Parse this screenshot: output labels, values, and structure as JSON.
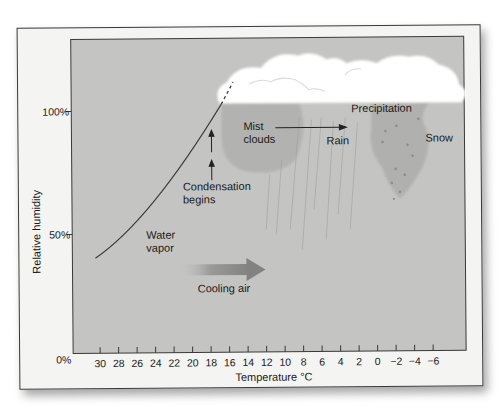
{
  "diagram": {
    "y_axis": {
      "label": "Relative humidity",
      "ticks": [
        "100%",
        "50%",
        "0%"
      ]
    },
    "x_axis": {
      "label": "Temperature °C",
      "ticks": [
        "30",
        "28",
        "26",
        "24",
        "22",
        "20",
        "18",
        "16",
        "14",
        "12",
        "10",
        "8",
        "6",
        "4",
        "2",
        "0",
        "−2",
        "−4",
        "−6"
      ]
    },
    "labels": {
      "water_vapor_1": "Water",
      "water_vapor_2": "vapor",
      "cooling_air": "Cooling air",
      "condensation_1": "Condensation",
      "condensation_2": "begins",
      "mist_1": "Mist",
      "mist_2": "clouds",
      "rain": "Rain",
      "precipitation": "Precipitation",
      "snow": "Snow"
    },
    "colors": {
      "plot_bg": "#c4c4c2",
      "frame_bg": "#f4f4f2",
      "cloud": "#ffffff",
      "mist": "#b2b2b0",
      "snow_zone": "#b0b0ae",
      "arrow": "#8a8a88",
      "line": "#3c3c3c"
    }
  }
}
